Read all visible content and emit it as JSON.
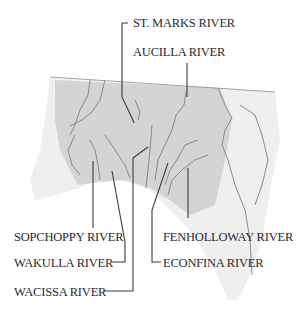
{
  "map": {
    "region": "Big Bend, Florida",
    "colors": {
      "land_shaded": "#d6d6d6",
      "land_light": "#efefef",
      "river": "#8a8a8a",
      "leader": "#3a3a3a",
      "label": "#2a2a2a",
      "background": "#ffffff"
    },
    "labels": [
      {
        "id": "st-marks",
        "text": "ST. MARKS RIVER"
      },
      {
        "id": "aucilla",
        "text": "AUCILLA RIVER"
      },
      {
        "id": "sopchoppy",
        "text": "SOPCHOPPY RIVER"
      },
      {
        "id": "wakulla",
        "text": "WAKULLA RIVER"
      },
      {
        "id": "wacissa",
        "text": "WACISSA RIVER"
      },
      {
        "id": "fenholloway",
        "text": "FENHOLLOWAY RIVER"
      },
      {
        "id": "econfina",
        "text": "ECONFINA RIVER"
      }
    ]
  }
}
